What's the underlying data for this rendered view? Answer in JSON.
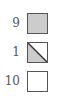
{
  "legend": {
    "items": [
      {
        "label": "9",
        "style": "filled",
        "fill_color": "#cccccc",
        "icon": "filled-square-icon"
      },
      {
        "label": "1",
        "style": "half-diagonal",
        "fill_color": "#cccccc",
        "icon": "diagonal-half-square-icon"
      },
      {
        "label": "10",
        "style": "empty",
        "fill_color": "#ffffff",
        "icon": "empty-square-icon"
      }
    ],
    "border_color": "#555555"
  }
}
